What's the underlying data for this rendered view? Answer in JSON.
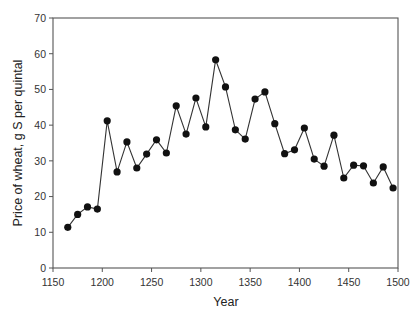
{
  "chart_data": {
    "type": "line",
    "title": "",
    "xlabel": "Year",
    "ylabel": "Price of wheat, g S per quintal",
    "xlim": [
      1150,
      1500
    ],
    "ylim": [
      0,
      70
    ],
    "xticks": [
      1150,
      1200,
      1250,
      1300,
      1350,
      1400,
      1450,
      1500
    ],
    "yticks": [
      0,
      10,
      20,
      30,
      40,
      50,
      60,
      70
    ],
    "grid": false,
    "legend": null,
    "markers": "filled-circle",
    "series": [
      {
        "name": "Price of wheat",
        "x": [
          1165,
          1175,
          1185,
          1195,
          1205,
          1215,
          1225,
          1235,
          1245,
          1255,
          1265,
          1275,
          1285,
          1295,
          1305,
          1315,
          1325,
          1335,
          1345,
          1355,
          1365,
          1375,
          1385,
          1395,
          1405,
          1415,
          1425,
          1435,
          1445,
          1455,
          1465,
          1475,
          1485,
          1495
        ],
        "y": [
          11.4,
          15.0,
          17.1,
          16.5,
          41.2,
          26.9,
          35.3,
          28.0,
          31.9,
          35.9,
          32.2,
          45.4,
          37.5,
          47.6,
          39.5,
          58.3,
          50.7,
          38.7,
          36.1,
          47.3,
          49.3,
          40.4,
          32.0,
          33.1,
          39.2,
          30.5,
          28.5,
          37.2,
          25.2,
          28.8,
          28.6,
          23.8,
          28.3,
          22.4
        ]
      }
    ]
  },
  "colors": {
    "line": "#333333",
    "marker": "#111111",
    "frame": "#555555"
  }
}
